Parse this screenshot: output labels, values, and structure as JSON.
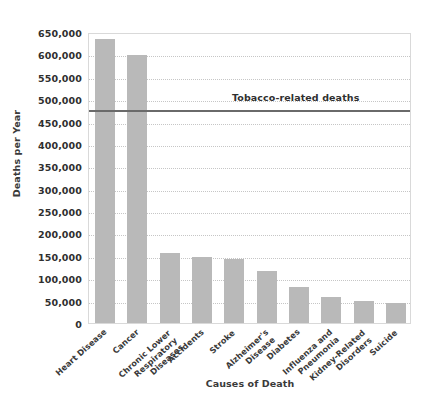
{
  "chart_data": {
    "type": "bar",
    "title": "",
    "xlabel": "Causes of Death",
    "ylabel": "Deaths per Year",
    "categories": [
      "Heart Disease",
      "Cancer",
      "Chronic Lower\nRespiratory\nDiseases",
      "Accidents",
      "Stroke",
      "Alzheimer's\nDisease",
      "Diabetes",
      "Influenza and\nPneumonia",
      "Kidney-Related\nDisorders",
      "Suicide"
    ],
    "values": [
      635000,
      598000,
      156000,
      147000,
      142000,
      116000,
      80000,
      57000,
      50000,
      45000
    ],
    "ylim": [
      0,
      650000
    ],
    "ytick_values": [
      0,
      50000,
      100000,
      150000,
      200000,
      250000,
      300000,
      350000,
      400000,
      450000,
      500000,
      550000,
      600000,
      650000
    ],
    "ytick_labels": [
      "0",
      "50,000",
      "100,000",
      "150,000",
      "200,000",
      "250,000",
      "300,000",
      "350,000",
      "400,000",
      "450,000",
      "500,000",
      "550,000",
      "600,000",
      "650,000"
    ],
    "grid": true,
    "legend": "none",
    "bar_color": "#b9b9b9",
    "annotations": [
      {
        "name": "tobacco-reference-line",
        "label": "Tobacco-related deaths",
        "value": 480000,
        "color": "#6a6a6a"
      }
    ]
  }
}
